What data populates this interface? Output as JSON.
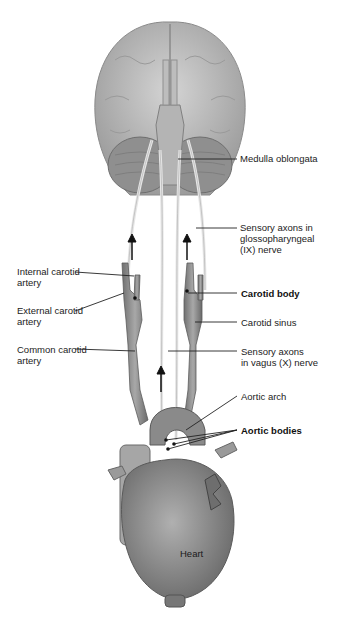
{
  "figure": {
    "labels": {
      "medulla": "Medulla oblongata",
      "glosso": "Sensory axons in\nglossopharyngeal\n(IX) nerve",
      "internal_carotid": "Internal carotid\nartery",
      "external_carotid": "External carotid\nartery",
      "common_carotid": "Common carotid\nartery",
      "carotid_body": "Carotid body",
      "carotid_sinus": "Carotid sinus",
      "vagus": "Sensory axons\nin vagus (X) nerve",
      "aortic_arch": "Aortic arch",
      "aortic_bodies": "Aortic bodies",
      "heart": "Heart"
    },
    "colors": {
      "tissue_light": "#c8c8c8",
      "tissue_mid": "#9a9a9a",
      "tissue_dark": "#6e6e6e",
      "nerve": "#e6e6e6",
      "leader_line": "#222222"
    }
  }
}
